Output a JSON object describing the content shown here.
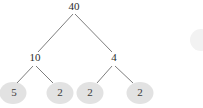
{
  "diagram": {
    "kind": "factor-tree",
    "title": "",
    "background_color": "#ffffff",
    "line_color": "#6e6e6e",
    "text_color": "#2b2b2b",
    "leaf_fill_color": "#e2e2e2",
    "root": {
      "value": "40",
      "x": 73,
      "y": 6
    },
    "internal_nodes": [
      {
        "value": "10",
        "x": 34,
        "y": 57
      },
      {
        "value": "4",
        "x": 114,
        "y": 57
      }
    ],
    "leaves": [
      {
        "value": "5",
        "cx": 13,
        "cy": 93,
        "rx": 13.5,
        "ry": 11
      },
      {
        "value": "2",
        "cx": 60,
        "cy": 93,
        "rx": 13.5,
        "ry": 11
      },
      {
        "value": "2",
        "cx": 90,
        "cy": 93,
        "rx": 13.5,
        "ry": 11
      },
      {
        "value": "2",
        "cx": 140,
        "cy": 93,
        "rx": 13.5,
        "ry": 11
      }
    ],
    "partial_shape": {
      "name": "cut-off-ellipse",
      "cx": 201,
      "cy": 40,
      "rx": 11,
      "ry": 11,
      "fill": "#f2f2f2"
    },
    "edges": [
      {
        "from": "40",
        "to": "10",
        "x1": 73,
        "y1": 14,
        "x2": 38,
        "y2": 52
      },
      {
        "from": "40",
        "to": "4",
        "x1": 75,
        "y1": 14,
        "x2": 112,
        "y2": 52
      },
      {
        "from": "10",
        "to": "5",
        "x1": 33,
        "y1": 66,
        "x2": 17,
        "y2": 83
      },
      {
        "from": "10",
        "to": "2",
        "x1": 36,
        "y1": 66,
        "x2": 53,
        "y2": 83
      },
      {
        "from": "4",
        "to": "2",
        "x1": 112,
        "y1": 66,
        "x2": 97,
        "y2": 83
      },
      {
        "from": "4",
        "to": "2",
        "x1": 115,
        "y1": 66,
        "x2": 133,
        "y2": 83
      }
    ]
  }
}
